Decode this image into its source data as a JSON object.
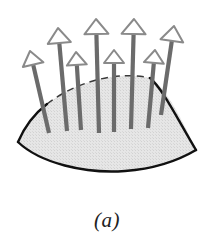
{
  "figure": {
    "caption": "(a)",
    "background_color": "#ffffff",
    "surface": {
      "name": "curved-surface-patch",
      "fill_color": "#e2e2e2",
      "stroke_color": "#111111",
      "stroke_width": 2.4,
      "hidden_edge_color": "#3a3a3a",
      "hidden_edge_dash": "7 5",
      "path": "M 150 78 C 120 71 78 80 47 104 C 34 114 24 128 18 142 C 40 163 85 174 125 171 C 152 169 174 163 196 150 C 188 132 178 112 168 97 C 163 89 157 82 150 78 Z",
      "top_edge_path": "M 47 104 C 78 80 120 71 150 78",
      "bottom_edge_path": "M 18 142 C 40 163 85 174 125 171 C 152 169 174 163 196 150",
      "left_edge_path": "M 47 104 C 34 114 24 128 18 142",
      "right_edge_path": "M 150 78 C 163 89 178 120 196 150"
    },
    "arrows": {
      "name": "normal-vector-arrows",
      "count": 8,
      "shaft_color": "#6b6b6b",
      "shaft_width": 4.2,
      "head_fill": "#ffffff",
      "head_stroke": "#8a8a8a",
      "head_stroke_width": 2,
      "items": [
        {
          "id": "arrow-1",
          "base_x": 49,
          "base_y": 133,
          "tip_x": 30,
          "tip_y": 51,
          "head_w": 21,
          "head_h": 14
        },
        {
          "id": "arrow-2",
          "base_x": 67,
          "base_y": 131,
          "tip_x": 58,
          "tip_y": 28,
          "head_w": 23,
          "head_h": 15
        },
        {
          "id": "arrow-3",
          "base_x": 81,
          "base_y": 130,
          "tip_x": 76,
          "tip_y": 52,
          "head_w": 20,
          "head_h": 13
        },
        {
          "id": "arrow-4",
          "base_x": 99,
          "base_y": 133,
          "tip_x": 96,
          "tip_y": 19,
          "head_w": 24,
          "head_h": 15
        },
        {
          "id": "arrow-5",
          "base_x": 114,
          "base_y": 132,
          "tip_x": 114,
          "tip_y": 50,
          "head_w": 20,
          "head_h": 13
        },
        {
          "id": "arrow-6",
          "base_x": 131,
          "base_y": 129,
          "tip_x": 134,
          "tip_y": 19,
          "head_w": 24,
          "head_h": 15
        },
        {
          "id": "arrow-7",
          "base_x": 148,
          "base_y": 128,
          "tip_x": 155,
          "tip_y": 50,
          "head_w": 20,
          "head_h": 13
        },
        {
          "id": "arrow-8",
          "base_x": 161,
          "base_y": 115,
          "tip_x": 174,
          "tip_y": 26,
          "head_w": 23,
          "head_h": 15
        }
      ]
    }
  }
}
